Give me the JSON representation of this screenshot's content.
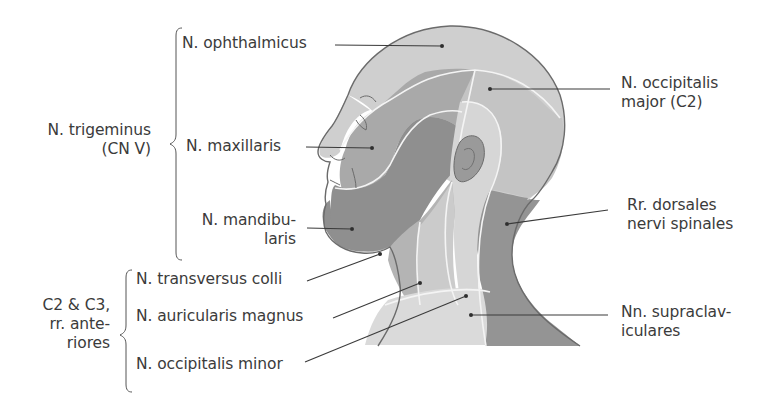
{
  "figure": {
    "colors": {
      "background": "#ffffff",
      "text": "#3b3b3b",
      "leader_line": "#3a3a3a",
      "outline": "#6b6b6b",
      "boundary_line": "#f2f2f2",
      "ophthalmicus_region": "#cfcfcf",
      "maxillaris_region": "#a9a9a9",
      "mandibularis_region": "#8f8f8f",
      "occipitalis_major_region": "#c4c4c4",
      "occipitalis_minor_region": "#d6d6d6",
      "dorsales_region": "#949494",
      "transversus_colli_region": "#b4b4b4",
      "auricularis_magnus_region": "#cbcbcb",
      "supraclaviculares_region": "#dadada",
      "ear": "#9a9a9a"
    }
  },
  "groups": {
    "trigeminus": {
      "line1": "N. trigeminus",
      "line2": "(CN V)"
    },
    "cervical": {
      "line1": "C2 & C3,",
      "line2": "rr. ante-",
      "line3": "riores"
    }
  },
  "labels": {
    "ophthalmicus": "N. ophthalmicus",
    "maxillaris": "N. maxillaris",
    "mandibularis_line1": "N. mandibu-",
    "mandibularis_line2": "laris",
    "transversus_colli": "N. transversus colli",
    "auricularis_magnus": "N. auricularis magnus",
    "occipitalis_minor": "N. occipitalis minor",
    "occipitalis_major_line1": "N. occipitalis",
    "occipitalis_major_line2": "major (C2)",
    "dorsales_line1": "Rr. dorsales",
    "dorsales_line2": "nervi spinales",
    "supraclaviculares_line1": "Nn. supraclav-",
    "supraclaviculares_line2": "iculares"
  }
}
